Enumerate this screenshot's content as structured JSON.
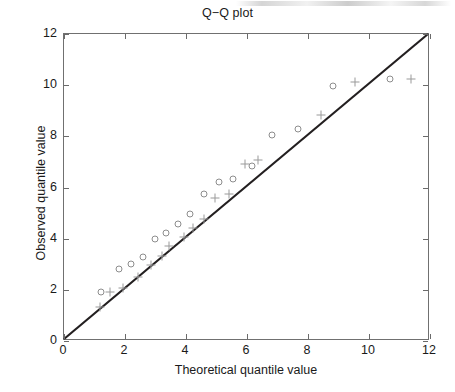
{
  "chart_data": {
    "type": "scatter",
    "title": "Q−Q plot",
    "xlabel": "Theoretical quantile value",
    "ylabel": "Observed quantile value",
    "xlim": [
      0,
      12
    ],
    "ylim": [
      0,
      12
    ],
    "xticks": [
      0,
      2,
      4,
      6,
      8,
      10,
      12
    ],
    "yticks": [
      0,
      2,
      4,
      6,
      8,
      10,
      12
    ],
    "xtick_labels": [
      "0",
      "2",
      "4",
      "6",
      "8",
      "10",
      "12"
    ],
    "ytick_labels": [
      "0",
      "2",
      "4",
      "6",
      "8",
      "10",
      "12"
    ],
    "grid": false,
    "legend": "none",
    "colors": {
      "reference_line": "#231f20",
      "circle_marker": "#8d8d8d",
      "plus_marker": "#9a9a9a",
      "axis": "#707070",
      "text": "#1a1a1a",
      "background": "#ffffff"
    },
    "reference_line": {
      "name": "y = x identity line",
      "x": [
        0,
        12
      ],
      "y": [
        0,
        12
      ],
      "style": "solid",
      "width": 2.2
    },
    "series": [
      {
        "name": "circle-series",
        "marker": "o",
        "points": [
          {
            "x": 1.2,
            "y": 1.93
          },
          {
            "x": 1.8,
            "y": 2.8
          },
          {
            "x": 2.2,
            "y": 3.0
          },
          {
            "x": 2.6,
            "y": 3.3
          },
          {
            "x": 2.98,
            "y": 3.98
          },
          {
            "x": 3.35,
            "y": 4.22
          },
          {
            "x": 3.75,
            "y": 4.57
          },
          {
            "x": 4.13,
            "y": 4.97
          },
          {
            "x": 4.6,
            "y": 5.76
          },
          {
            "x": 5.07,
            "y": 6.22
          },
          {
            "x": 5.55,
            "y": 6.35
          },
          {
            "x": 6.15,
            "y": 6.85
          },
          {
            "x": 6.83,
            "y": 8.05
          },
          {
            "x": 7.67,
            "y": 8.28
          },
          {
            "x": 8.82,
            "y": 9.95
          },
          {
            "x": 10.68,
            "y": 10.25
          }
        ]
      },
      {
        "name": "plus-series",
        "marker": "+",
        "points": [
          {
            "x": 1.18,
            "y": 1.32
          },
          {
            "x": 1.52,
            "y": 1.93
          },
          {
            "x": 1.95,
            "y": 2.08
          },
          {
            "x": 2.42,
            "y": 2.52
          },
          {
            "x": 2.85,
            "y": 2.98
          },
          {
            "x": 3.22,
            "y": 3.33
          },
          {
            "x": 3.45,
            "y": 3.73
          },
          {
            "x": 3.95,
            "y": 4.08
          },
          {
            "x": 4.22,
            "y": 4.4
          },
          {
            "x": 4.58,
            "y": 4.77
          },
          {
            "x": 4.95,
            "y": 5.6
          },
          {
            "x": 5.42,
            "y": 5.75
          },
          {
            "x": 5.95,
            "y": 6.92
          },
          {
            "x": 6.35,
            "y": 7.08
          },
          {
            "x": 8.42,
            "y": 8.82
          },
          {
            "x": 9.55,
            "y": 10.12
          },
          {
            "x": 11.38,
            "y": 10.25
          }
        ]
      }
    ]
  }
}
